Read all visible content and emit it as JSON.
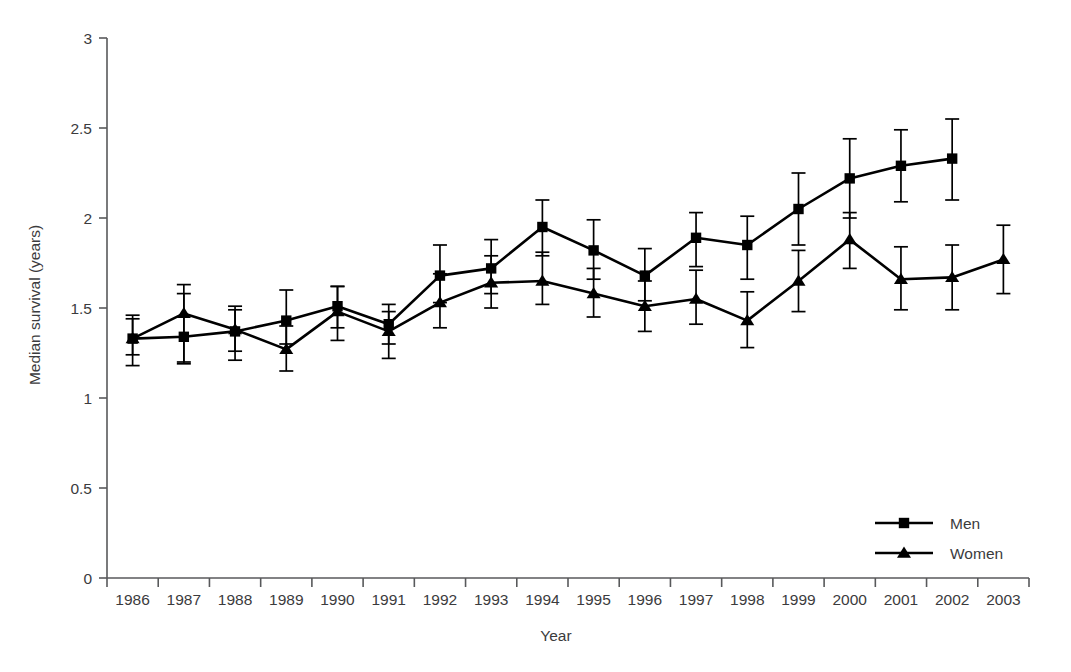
{
  "chart_data": {
    "type": "line",
    "title": "",
    "xlabel": "Year",
    "ylabel": "Median survival (years)",
    "xlim": [
      1985.5,
      2003.5
    ],
    "ylim": [
      0,
      3
    ],
    "grid": false,
    "legend_position": "bottom-right",
    "yticks": [
      "0",
      "0.5",
      "1",
      "1.5",
      "2",
      "2.5",
      "3"
    ],
    "ytick_values": [
      0,
      0.5,
      1,
      1.5,
      2,
      2.5,
      3
    ],
    "categories": [
      1986,
      1987,
      1988,
      1989,
      1990,
      1991,
      1992,
      1993,
      1994,
      1995,
      1996,
      1997,
      1998,
      1999,
      2000,
      2001,
      2002,
      2003
    ],
    "xtick_labels": [
      "1986",
      "1987",
      "1988",
      "1989",
      "1990",
      "1991",
      "1992",
      "1993",
      "1994",
      "1995",
      "1996",
      "1997",
      "1998",
      "1999",
      "2000",
      "2001",
      "2002",
      "2003"
    ],
    "series": [
      {
        "name": "Men",
        "marker": "square",
        "color": "#000000",
        "x": [
          1986,
          1987,
          1988,
          1989,
          1990,
          1991,
          1992,
          1993,
          1994,
          1995,
          1996,
          1997,
          1998,
          1999,
          2000,
          2001,
          2002
        ],
        "values": [
          1.33,
          1.34,
          1.37,
          1.43,
          1.51,
          1.41,
          1.68,
          1.72,
          1.95,
          1.82,
          1.68,
          1.89,
          1.85,
          2.05,
          2.22,
          2.29,
          2.33
        ],
        "err_low": [
          1.24,
          1.2,
          1.26,
          1.3,
          1.39,
          1.3,
          1.53,
          1.58,
          1.79,
          1.66,
          1.54,
          1.73,
          1.66,
          1.85,
          2.0,
          2.09,
          2.1
        ],
        "err_high": [
          1.44,
          1.58,
          1.49,
          1.6,
          1.62,
          1.52,
          1.85,
          1.88,
          2.1,
          1.99,
          1.83,
          2.03,
          2.01,
          2.25,
          2.44,
          2.49,
          2.55
        ]
      },
      {
        "name": "Women",
        "marker": "triangle",
        "color": "#000000",
        "x": [
          1986,
          1987,
          1988,
          1989,
          1990,
          1991,
          1992,
          1993,
          1994,
          1995,
          1996,
          1997,
          1998,
          1999,
          2000,
          2001,
          2002,
          2003
        ],
        "values": [
          1.33,
          1.47,
          1.38,
          1.27,
          1.48,
          1.37,
          1.53,
          1.64,
          1.65,
          1.58,
          1.51,
          1.55,
          1.43,
          1.65,
          1.88,
          1.66,
          1.67,
          1.77
        ],
        "err_low": [
          1.18,
          1.19,
          1.21,
          1.15,
          1.32,
          1.22,
          1.39,
          1.5,
          1.52,
          1.45,
          1.37,
          1.41,
          1.28,
          1.48,
          1.72,
          1.49,
          1.49,
          1.58
        ],
        "err_high": [
          1.46,
          1.63,
          1.51,
          1.4,
          1.62,
          1.48,
          1.69,
          1.79,
          1.81,
          1.72,
          1.65,
          1.71,
          1.59,
          1.82,
          2.03,
          1.84,
          1.85,
          1.96
        ]
      }
    ],
    "legend": [
      {
        "label": "Men",
        "marker": "square"
      },
      {
        "label": "Women",
        "marker": "triangle"
      }
    ]
  }
}
